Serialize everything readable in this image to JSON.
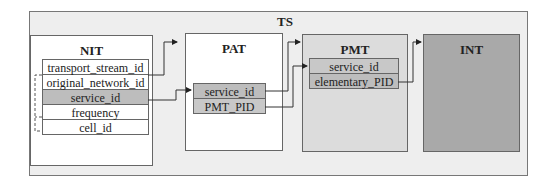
{
  "diagram": {
    "container": {
      "label": "TS"
    },
    "tables": {
      "nit": {
        "title": "NIT",
        "fields": [
          "transport_stream_id",
          "original_network_id",
          "service_id",
          "frequency",
          "cell_id"
        ],
        "highlighted_field": "service_id"
      },
      "pat": {
        "title": "PAT",
        "fields": [
          "service_id",
          "PMT_PID"
        ]
      },
      "pmt": {
        "title": "PMT",
        "fields": [
          "service_id",
          "elementary_PID"
        ]
      },
      "int": {
        "title": "INT",
        "fields": []
      }
    },
    "connections": [
      {
        "from": "NIT.transport_stream_id",
        "to": "PAT",
        "style": "solid-arrow"
      },
      {
        "from": "NIT.service_id",
        "to": "PAT.service_id",
        "style": "solid-arrow"
      },
      {
        "from": "PAT.service_id",
        "to": "PMT",
        "style": "solid-arrow"
      },
      {
        "from": "PAT.PMT_PID",
        "to": "PMT.service_id",
        "style": "solid-arrow"
      },
      {
        "from": "PMT.elementary_PID",
        "to": "INT",
        "style": "solid-arrow"
      },
      {
        "from": "NIT.original_network_id",
        "to": "NIT.cell_id",
        "style": "dashed-bracket"
      },
      {
        "from": "NIT.frequency",
        "to": "NIT.cell_id",
        "style": "dashed-bracket"
      }
    ],
    "colors": {
      "container_bg": "#eeeeee",
      "nit_bg": "#ffffff",
      "pat_bg": "#ffffff",
      "pmt_bg": "#dcdcdc",
      "int_bg": "#a9a9a9",
      "highlight_row": "#bdbdbd"
    }
  }
}
